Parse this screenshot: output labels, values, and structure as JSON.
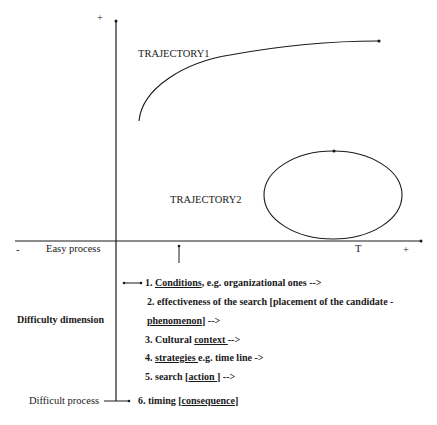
{
  "axes": {
    "y_plus": "+",
    "x_minus": "-",
    "x_plus": "+",
    "x_tick_T": "T",
    "x_left_label": "Easy process"
  },
  "trajectories": [
    {
      "label": "TRAJECTORY1",
      "shape": "rising-curve"
    },
    {
      "label": "TRAJECTORY2",
      "shape": "closed-ellipse"
    }
  ],
  "side_labels": {
    "difficulty_dimension": "Difficulty dimension",
    "difficult_process": "Difficult process"
  },
  "list": [
    {
      "prefix": "1. ",
      "key": "Conditions",
      "suffix": ", e.g. organizational ones -->"
    },
    {
      "prefix": "2. effectiveness of the search [placement of the candidate -",
      "key": "",
      "suffix": ""
    },
    {
      "prefix": "",
      "key": "phenomenon",
      "suffix": "] -->"
    },
    {
      "prefix": "3. Cultural ",
      "key": "context ",
      "suffix": " -->"
    },
    {
      "prefix": "4. ",
      "key": "strategies ",
      "suffix": "e.g. time line ->"
    },
    {
      "prefix": "5. search [",
      "key": "action ",
      "suffix": "] -->"
    },
    {
      "prefix": "6. timing [",
      "key": "consequence",
      "suffix": "]"
    }
  ]
}
